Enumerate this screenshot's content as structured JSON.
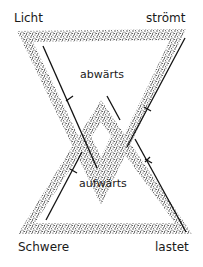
{
  "diagram": {
    "type": "interlocking-triangles",
    "labels": {
      "top_left": "Licht",
      "top_right": "strömt",
      "bottom_left": "Schwere",
      "bottom_right": "lastet",
      "upper_center": "abwärts",
      "lower_center": "aufwärts"
    },
    "colors": {
      "stipple": "#2a2a2a",
      "line": "#111111",
      "background": "#ffffff"
    },
    "shapes": [
      {
        "name": "downward-triangle",
        "meaning": "Licht strömt abwärts"
      },
      {
        "name": "upward-triangle",
        "meaning": "Schwere lastet aufwärts"
      }
    ]
  }
}
